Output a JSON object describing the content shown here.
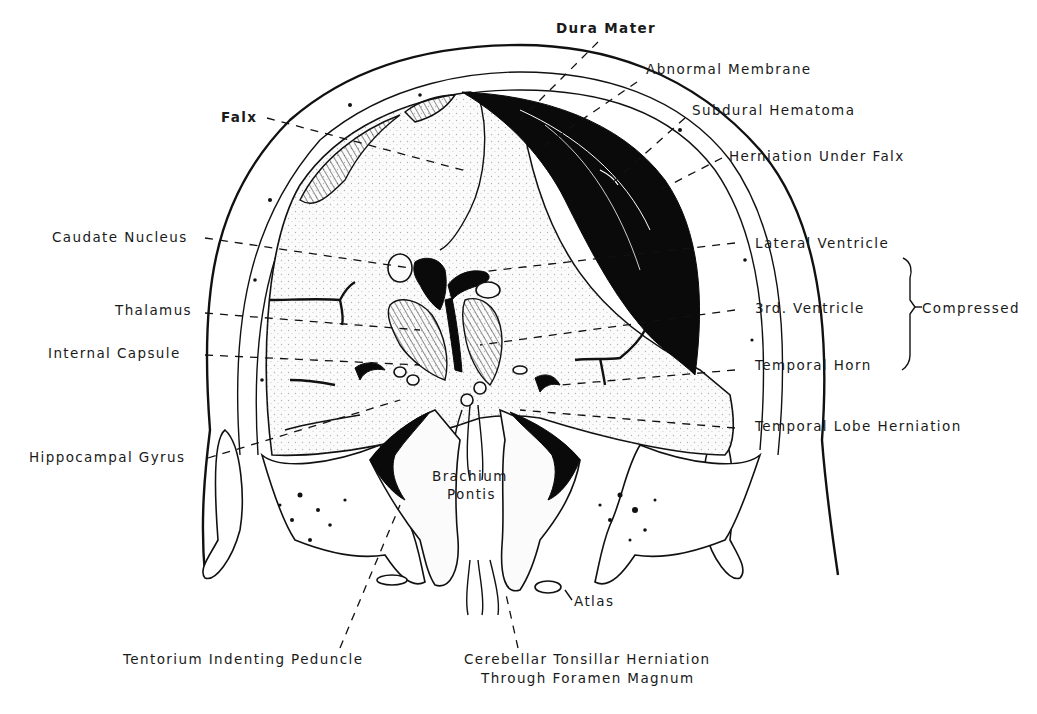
{
  "figure": {
    "colors": {
      "ink": "#111111",
      "background": "#ffffff",
      "hematoma": "#0a0a0a"
    }
  },
  "labels": {
    "dura_mater": "Dura Mater",
    "abnormal_membrane": "Abnormal Membrane",
    "subdural_hematoma": "Subdural Hematoma",
    "herniation_under_falx": "Herniation Under Falx",
    "falx": "Falx",
    "caudate_nucleus": "Caudate Nucleus",
    "lateral_ventricle": "Lateral Ventricle",
    "third_ventricle": "3rd. Ventricle",
    "compressed": "Compressed",
    "thalamus": "Thalamus",
    "internal_capsule": "Internal Capsule",
    "temporal_horn": "Temporal Horn",
    "temporal_lobe_herniation": "Temporal Lobe Herniation",
    "hippocampal_gyrus": "Hippocampal Gyrus",
    "brachium_pontis_line1": "Brachium",
    "brachium_pontis_line2": "Pontis",
    "atlas": "Atlas",
    "tentorium_indenting_peduncle": "Tentorium Indenting Peduncle",
    "cerebellar_herniation_line1": "Cerebellar Tonsillar Herniation",
    "cerebellar_herniation_line2": "Through Foramen Magnum"
  }
}
